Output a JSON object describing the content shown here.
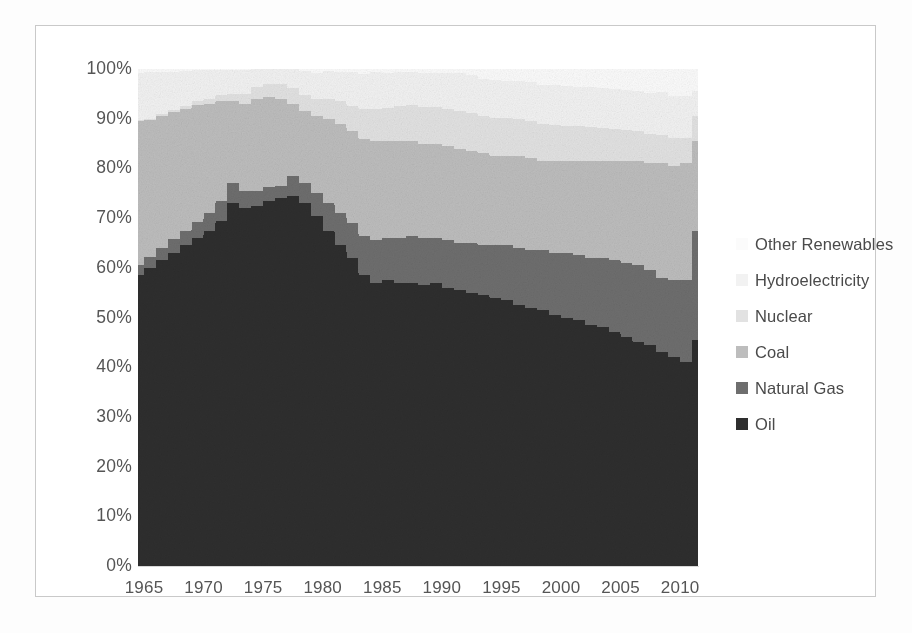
{
  "chart_data": {
    "type": "area",
    "subtype": "100-percent-stacked-area",
    "title": "",
    "subtitle": "",
    "xlabel": "",
    "ylabel": "",
    "xlim": [
      1965,
      2012
    ],
    "ylim": [
      0,
      100
    ],
    "grid": false,
    "legend_position": "right",
    "x_tick_labels": [
      "1965",
      "1970",
      "1975",
      "1980",
      "1985",
      "1990",
      "1995",
      "2000",
      "2005",
      "2010"
    ],
    "x_tick_values": [
      1965,
      1970,
      1975,
      1980,
      1985,
      1990,
      1995,
      2000,
      2005,
      2010
    ],
    "y_tick_labels": [
      "0%",
      "10%",
      "20%",
      "30%",
      "40%",
      "50%",
      "60%",
      "70%",
      "80%",
      "90%",
      "100%"
    ],
    "y_tick_values": [
      0,
      10,
      20,
      30,
      40,
      50,
      60,
      70,
      80,
      90,
      100
    ],
    "x": [
      1965,
      1966,
      1967,
      1968,
      1969,
      1970,
      1971,
      1972,
      1973,
      1974,
      1975,
      1976,
      1977,
      1978,
      1979,
      1980,
      1981,
      1982,
      1983,
      1984,
      1985,
      1986,
      1987,
      1988,
      1989,
      1990,
      1991,
      1992,
      1993,
      1994,
      1995,
      1996,
      1997,
      1998,
      1999,
      2000,
      2001,
      2002,
      2003,
      2004,
      2005,
      2006,
      2007,
      2008,
      2009,
      2010,
      2011,
      2012
    ],
    "series": [
      {
        "name": "Oil",
        "color": "#2e2e2e",
        "values": [
          58.5,
          60.0,
          61.5,
          63.0,
          64.5,
          66.0,
          67.5,
          69.5,
          73.0,
          72.0,
          72.5,
          73.5,
          74.0,
          74.5,
          73.0,
          70.5,
          67.5,
          64.5,
          62.0,
          58.5,
          57.0,
          57.5,
          57.0,
          57.0,
          56.5,
          57.0,
          56.0,
          55.5,
          55.0,
          54.5,
          54.0,
          53.5,
          52.5,
          52.0,
          51.5,
          50.5,
          50.0,
          49.5,
          48.5,
          48.0,
          47.0,
          46.0,
          45.0,
          44.5,
          43.0,
          42.0,
          41.0,
          45.5
        ]
      },
      {
        "name": "Natural Gas",
        "color": "#6e6e6e",
        "values": [
          2.0,
          2.2,
          2.5,
          2.8,
          3.0,
          3.2,
          3.5,
          4.0,
          4.0,
          3.5,
          3.0,
          2.8,
          2.5,
          4.0,
          4.0,
          4.5,
          5.5,
          6.5,
          7.0,
          8.0,
          8.5,
          8.5,
          9.0,
          9.5,
          9.5,
          9.0,
          9.5,
          9.5,
          10.0,
          10.0,
          10.5,
          11.0,
          11.5,
          11.5,
          12.0,
          12.5,
          13.0,
          13.0,
          13.5,
          14.0,
          14.5,
          15.0,
          15.5,
          15.0,
          15.0,
          15.5,
          16.5,
          22.0
        ]
      },
      {
        "name": "Coal",
        "color": "#bdbdbd",
        "values": [
          29.0,
          27.5,
          26.5,
          25.5,
          24.5,
          23.5,
          22.0,
          20.0,
          16.5,
          17.5,
          18.5,
          18.0,
          17.5,
          14.5,
          14.5,
          15.5,
          17.0,
          18.0,
          18.5,
          19.5,
          20.0,
          19.5,
          19.5,
          19.0,
          19.0,
          19.0,
          19.0,
          19.0,
          18.5,
          18.5,
          18.0,
          18.0,
          18.5,
          18.5,
          18.0,
          18.5,
          18.5,
          19.0,
          19.5,
          19.5,
          20.0,
          20.5,
          21.0,
          21.5,
          23.0,
          23.0,
          23.5,
          18.0
        ]
      },
      {
        "name": "Nuclear",
        "color": "#e2e2e2",
        "values": [
          0.2,
          0.3,
          0.4,
          0.5,
          0.6,
          0.8,
          1.0,
          1.3,
          1.5,
          1.9,
          2.3,
          2.7,
          3.0,
          3.2,
          3.3,
          3.5,
          4.0,
          4.5,
          5.0,
          6.0,
          6.5,
          6.7,
          7.0,
          7.2,
          7.3,
          7.3,
          7.5,
          7.5,
          7.6,
          7.6,
          7.7,
          7.6,
          7.5,
          7.5,
          7.5,
          7.2,
          7.0,
          7.0,
          6.8,
          6.6,
          6.5,
          6.3,
          6.0,
          6.0,
          5.8,
          5.7,
          5.2,
          5.0
        ]
      },
      {
        "name": "Hydroelectricity",
        "color": "#f2f2f2",
        "values": [
          9.5,
          9.3,
          8.4,
          7.5,
          7.0,
          6.3,
          5.7,
          5.0,
          4.7,
          4.8,
          4.8,
          4.5,
          4.2,
          5.0,
          4.7,
          5.2,
          5.5,
          5.9,
          6.8,
          7.0,
          7.3,
          7.0,
          6.8,
          6.7,
          6.9,
          6.8,
          7.2,
          7.6,
          7.6,
          7.4,
          7.5,
          7.5,
          7.5,
          7.8,
          7.8,
          8.1,
          8.0,
          7.9,
          8.0,
          8.0,
          8.0,
          8.0,
          8.0,
          8.2,
          8.6,
          8.3,
          8.3,
          5.0
        ]
      },
      {
        "name": "Other Renewables",
        "color": "#fbfbfb",
        "values": [
          0.8,
          0.7,
          0.7,
          0.7,
          0.4,
          0.2,
          0.3,
          0.2,
          0.3,
          0.3,
          0.9,
          0.5,
          1.8,
          0.8,
          0.5,
          0.8,
          0.5,
          0.6,
          0.7,
          1.0,
          0.7,
          0.8,
          0.7,
          0.6,
          0.8,
          0.9,
          0.8,
          0.9,
          1.3,
          2.0,
          2.3,
          2.4,
          2.5,
          2.7,
          3.2,
          3.2,
          3.5,
          3.6,
          3.7,
          3.9,
          4.0,
          4.2,
          4.5,
          4.8,
          4.6,
          5.5,
          5.5,
          4.5
        ]
      }
    ]
  },
  "legend": {
    "items": [
      {
        "label": "Other Renewables",
        "color": "#fbfbfb"
      },
      {
        "label": "Hydroelectricity",
        "color": "#f2f2f2"
      },
      {
        "label": "Nuclear",
        "color": "#e2e2e2"
      },
      {
        "label": "Coal",
        "color": "#bdbdbd"
      },
      {
        "label": "Natural Gas",
        "color": "#6e6e6e"
      },
      {
        "label": "Oil",
        "color": "#2e2e2e"
      }
    ]
  }
}
